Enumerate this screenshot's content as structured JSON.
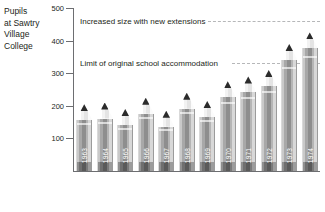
{
  "chart_data": {
    "type": "bar",
    "title": "Pupils at Sawtry Village College",
    "xlabel": "",
    "ylabel": "Pupils at Sawtry Village College",
    "categories": [
      "1963",
      "1964",
      "1965",
      "1966",
      "1967",
      "1968",
      "1969",
      "1970",
      "1971",
      "1972",
      "1973",
      "1974"
    ],
    "values": [
      205,
      210,
      190,
      225,
      185,
      240,
      215,
      275,
      290,
      310,
      390,
      425
    ],
    "ylim": [
      0,
      500
    ],
    "yticks": [
      100,
      200,
      300,
      400,
      500
    ],
    "ytick_labels": [
      "100",
      "200",
      "300",
      "400",
      "500"
    ],
    "grid": false,
    "legend": "none",
    "annotations": [
      {
        "text": "Increased size with new extensions",
        "value": 460
      },
      {
        "text": "Limit of original school accommodation",
        "value": 330
      }
    ]
  },
  "y_axis_title": {
    "lines": [
      "Pupils",
      "at Sawtry",
      "Village",
      "College"
    ]
  },
  "colors": {
    "axis": "#6d6e71",
    "text": "#231f20",
    "dashed_line": "#b6b7b9",
    "pencil_lead": "#2b2b2b",
    "pencil_body": "#8e8e8e",
    "year_label": "#ffffff"
  }
}
